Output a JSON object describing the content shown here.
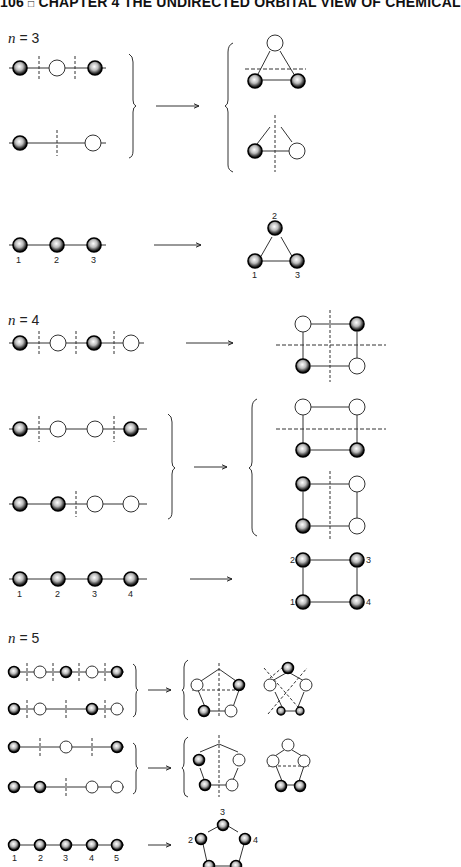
{
  "header": {
    "page_number": "106",
    "separator": "□",
    "running_title": "CHAPTER 4   THE UNDIRECTED ORBITAL VIEW OF CHEMICAL"
  },
  "sections": [
    {
      "label_var": "n",
      "label_eq": " = 3",
      "description": "Linear chains of 3 orbitals mapped to triangular rings"
    },
    {
      "label_var": "n",
      "label_eq": " = 4",
      "description": "Linear chains of 4 orbitals mapped to square rings"
    },
    {
      "label_var": "n",
      "label_eq": " = 5",
      "description": "Linear chains of 5 orbitals mapped to pentagonal rings"
    }
  ],
  "numbering": {
    "n3_chain": [
      "1",
      "2",
      "3"
    ],
    "n3_ring": [
      "2",
      "1",
      "3"
    ],
    "n4_chain": [
      "1",
      "2",
      "3",
      "4"
    ],
    "n4_ring": [
      "2",
      "3",
      "1",
      "4"
    ],
    "n5_chain": [
      "1",
      "2",
      "3",
      "4",
      "5"
    ],
    "n5_ring": [
      "3",
      "2",
      "4"
    ]
  },
  "legend": {
    "filled_orbital": "shaded sphere (phase +)",
    "empty_orbital": "open circle (phase −)",
    "node": "dashed line"
  },
  "colors": {
    "ink": "#111111",
    "line": "#333333",
    "background": "#ffffff"
  }
}
